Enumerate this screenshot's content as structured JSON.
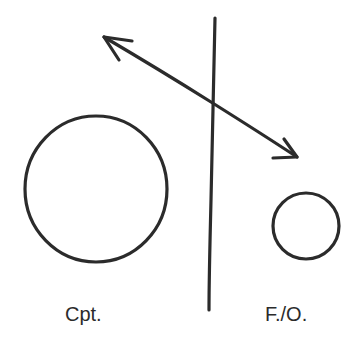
{
  "diagram": {
    "stroke_color": "#2b2b2b",
    "background": "#ffffff",
    "labels": {
      "left": "Cpt.",
      "right": "F./O."
    },
    "shapes": {
      "captain_circle": {
        "cx": 96,
        "cy": 189,
        "rx": 71,
        "ry": 73
      },
      "first_officer_circle": {
        "cx": 306,
        "cy": 226,
        "r": 33
      },
      "divider_line": {
        "x1": 215,
        "y1": 18,
        "x2": 209,
        "y2": 310
      },
      "double_arrow": {
        "x1": 104,
        "y1": 37,
        "x2": 297,
        "y2": 157
      }
    }
  }
}
